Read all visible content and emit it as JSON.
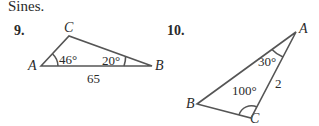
{
  "heading": "Sines.",
  "problems": [
    {
      "number": "9.",
      "vertices": {
        "A": "A",
        "B": "B",
        "C": "C"
      },
      "angle_A": "46°",
      "angle_B": "20°",
      "side_AB": "65"
    },
    {
      "number": "10.",
      "vertices": {
        "A": "A",
        "B": "B",
        "C": "C"
      },
      "angle_A": "30°",
      "angle_C": "100°",
      "side_AC": "2"
    }
  ],
  "colors": {
    "line": "#555555",
    "text": "#2a2a2a"
  }
}
